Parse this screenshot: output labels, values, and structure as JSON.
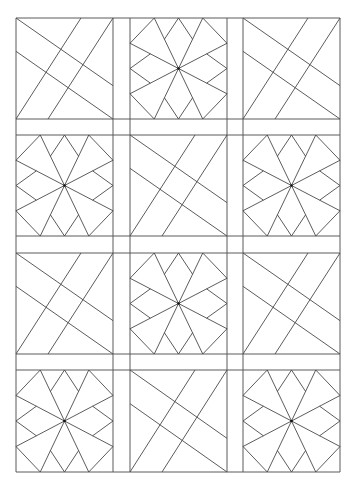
{
  "diagram": {
    "type": "quilt-block-pattern",
    "line_color": "#4a4a4a",
    "background": "#ffffff",
    "grid": {
      "columns": [
        [
          16,
          113
        ],
        [
          130,
          227
        ],
        [
          243,
          340
        ]
      ],
      "rows": [
        [
          18,
          119
        ],
        [
          135,
          236
        ],
        [
          253,
          354
        ],
        [
          370,
          472
        ]
      ]
    },
    "layout": [
      [
        "diagonal",
        "star",
        "diagonal"
      ],
      [
        "star",
        "diagonal",
        "star"
      ],
      [
        "diagonal",
        "star",
        "diagonal"
      ],
      [
        "star",
        "diagonal",
        "star"
      ]
    ],
    "block_types": {
      "diagonal": "four crossing slanted lines forming a woven lattice",
      "star": "eight-spoke star with corner and edge kites"
    }
  }
}
